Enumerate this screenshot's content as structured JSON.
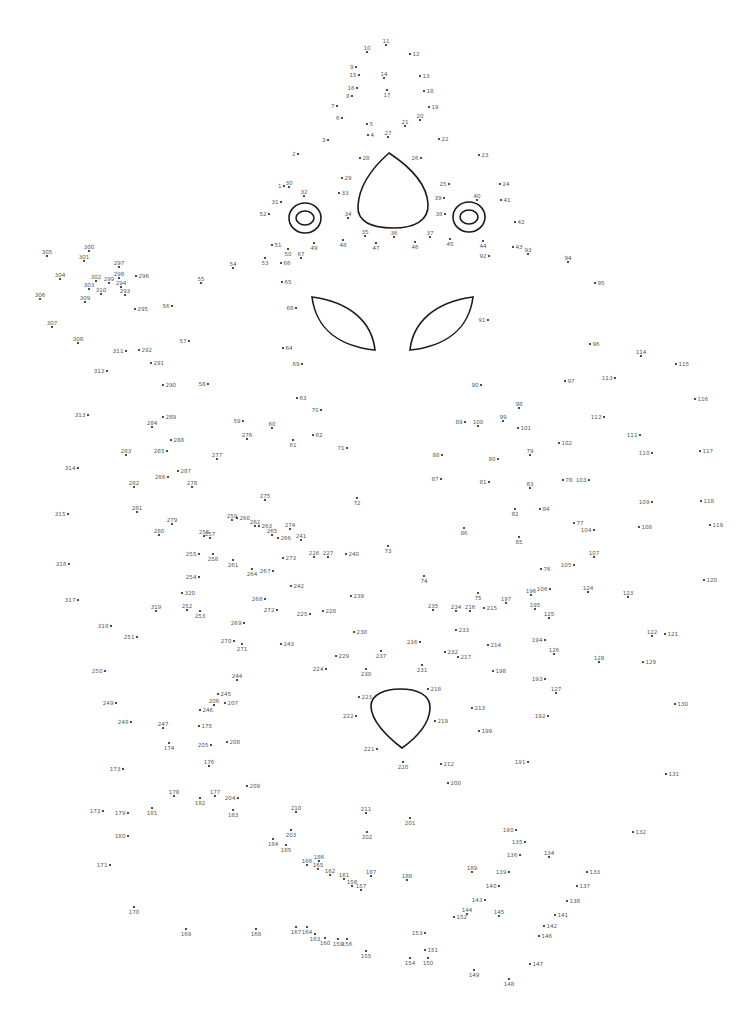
{
  "puzzle": {
    "type": "connect-the-dots",
    "first_dot": "1",
    "last_dot": "320",
    "line_color": "#1a1a1a",
    "dot_color": "#222222",
    "label_color": "#555555",
    "dots": [
      "1",
      "2",
      "3",
      "4",
      "5",
      "6",
      "7",
      "8",
      "9",
      "10",
      "11",
      "12",
      "13",
      "14",
      "15",
      "16",
      "17",
      "18",
      "19",
      "20",
      "21",
      "22",
      "23",
      "24",
      "25",
      "26",
      "27",
      "28",
      "29",
      "30",
      "31",
      "32",
      "33",
      "34",
      "35",
      "36",
      "37",
      "38",
      "39",
      "40",
      "41",
      "42",
      "43",
      "44",
      "45",
      "46",
      "47",
      "48",
      "49",
      "50",
      "51",
      "52",
      "53",
      "54",
      "55",
      "56",
      "57",
      "58",
      "59",
      "60",
      "61",
      "62",
      "63",
      "64",
      "65",
      "66",
      "67",
      "68",
      "69",
      "70",
      "71",
      "72",
      "73",
      "74",
      "75",
      "76",
      "77",
      "78",
      "79",
      "80",
      "81",
      "82",
      "83",
      "84",
      "85",
      "86",
      "87",
      "88",
      "89",
      "90",
      "91",
      "92",
      "93",
      "94",
      "95",
      "96",
      "97",
      "98",
      "99",
      "100",
      "101",
      "102",
      "103",
      "104",
      "105",
      "106",
      "107",
      "108",
      "109",
      "110",
      "111",
      "112",
      "113",
      "114",
      "115",
      "116",
      "117",
      "118",
      "119",
      "120",
      "121",
      "122",
      "123",
      "124",
      "125",
      "126",
      "127",
      "128",
      "129",
      "130",
      "131",
      "132",
      "133",
      "134",
      "135",
      "136",
      "137",
      "138",
      "139",
      "140",
      "141",
      "142",
      "143",
      "144",
      "145",
      "146",
      "147",
      "148",
      "149",
      "150",
      "151",
      "152",
      "153",
      "154",
      "155",
      "156",
      "157",
      "158",
      "159",
      "160",
      "161",
      "162",
      "163",
      "164",
      "165",
      "166",
      "167",
      "168",
      "169",
      "170",
      "171",
      "172",
      "173",
      "174",
      "175",
      "176",
      "177",
      "178",
      "179",
      "180",
      "181",
      "182",
      "183",
      "184",
      "185",
      "186",
      "187",
      "188",
      "189",
      "190",
      "191",
      "192",
      "193",
      "194",
      "195",
      "196",
      "197",
      "198",
      "199",
      "200",
      "201",
      "202",
      "203",
      "204",
      "205",
      "206",
      "207",
      "208",
      "209",
      "210",
      "211",
      "212",
      "213",
      "214",
      "215",
      "216",
      "217",
      "218",
      "219",
      "220",
      "221",
      "222",
      "223",
      "224",
      "225",
      "226",
      "227",
      "228",
      "229",
      "230",
      "231",
      "232",
      "233",
      "234",
      "235",
      "236",
      "237",
      "238",
      "239",
      "240",
      "241",
      "242",
      "243",
      "244",
      "245",
      "246",
      "247",
      "248",
      "249",
      "250",
      "251",
      "252",
      "253",
      "254",
      "255",
      "256",
      "257",
      "258",
      "259",
      "260",
      "261",
      "262",
      "263",
      "264",
      "265",
      "266",
      "267",
      "268",
      "269",
      "270",
      "271",
      "272",
      "273",
      "274",
      "275",
      "276",
      "277",
      "278",
      "279",
      "280",
      "281",
      "282",
      "283",
      "284",
      "285",
      "286",
      "287",
      "288",
      "289",
      "290",
      "291",
      "292",
      "293",
      "294",
      "295",
      "296",
      "297",
      "298",
      "299",
      "300",
      "301",
      "302",
      "303",
      "304",
      "305",
      "306",
      "307",
      "308",
      "309",
      "310",
      "311",
      "312",
      "313",
      "314",
      "315",
      "316",
      "317",
      "318",
      "319",
      "320"
    ],
    "preprinted_shapes": [
      "nose-shape",
      "left-eye",
      "right-eye",
      "left-leaf",
      "right-leaf",
      "mouth-shape"
    ]
  }
}
